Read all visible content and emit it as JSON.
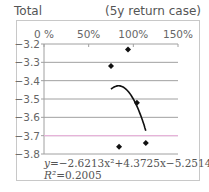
{
  "header": {
    "title": "Total",
    "subtitle": "(5y return case)"
  },
  "chart_data": {
    "type": "scatter",
    "title": "Total",
    "subtitle": "(5y return case)",
    "xlabel": "",
    "ylabel": "",
    "x_tick_labels": [
      "0 %",
      "50%",
      "100%",
      "150%"
    ],
    "x_ticks": [
      0,
      50,
      100,
      150
    ],
    "xlim": [
      0,
      150
    ],
    "x_axis_position": "top",
    "y_tick_labels": [
      "−3.2",
      "−3.3",
      "−3.4",
      "−3.5",
      "−3.6",
      "−3.7",
      "−3.8"
    ],
    "y_ticks": [
      -3.2,
      -3.3,
      -3.4,
      -3.5,
      -3.6,
      -3.7,
      -3.8
    ],
    "ylim": [
      -3.8,
      -3.2
    ],
    "grid": true,
    "series": [
      {
        "name": "Total",
        "points": [
          {
            "x": 94,
            "y": -3.23
          },
          {
            "x": 75,
            "y": -3.32
          },
          {
            "x": 104,
            "y": -3.52
          },
          {
            "x": 114,
            "y": -3.74
          },
          {
            "x": 84,
            "y": -3.76
          }
        ]
      }
    ],
    "trendline": {
      "type": "polynomial",
      "order": 2,
      "coefficients": [
        -2.6213,
        4.3725,
        -5.2514
      ],
      "x_range": [
        75,
        114
      ],
      "equation": "y = −2.6213x² + 4.3725x − 5.2514",
      "r_squared": "R²=0.2005"
    },
    "reference_line": {
      "y": -3.7,
      "color": "#e6b3d9"
    },
    "colors": {
      "grid": "#a0a0a0",
      "marker": "#111111",
      "trend": "#111111"
    }
  },
  "labels": {
    "equation_prefix": "y",
    "equation_body": "=−2.6213x²+4.3725x−5.2514",
    "r2_prefix": "R²",
    "r2_value": "=0.2005"
  }
}
